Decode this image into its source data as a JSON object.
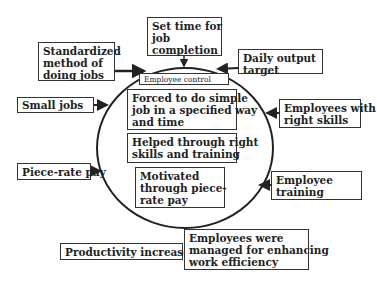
{
  "diagram": {
    "center_label": "Employee control",
    "inner_boxes": [
      {
        "id": "forced",
        "lines": [
          "Forced to do simple",
          "job in a specified way",
          "and time"
        ]
      },
      {
        "id": "helped",
        "lines": [
          "Helped through right",
          "skills and training"
        ]
      },
      {
        "id": "motivated",
        "lines": [
          "Motivated",
          "through piece-",
          "rate pay"
        ]
      }
    ],
    "outer_inputs": [
      {
        "id": "set-time",
        "lines": [
          "Set time for",
          "job",
          "completion"
        ]
      },
      {
        "id": "daily-output",
        "lines": [
          "Daily output",
          "target"
        ]
      },
      {
        "id": "standardized",
        "lines": [
          "Standardized",
          "method of",
          "doing jobs"
        ]
      },
      {
        "id": "small-jobs",
        "lines": [
          "Small jobs"
        ]
      },
      {
        "id": "right-skills",
        "lines": [
          "Employees with",
          "right skills"
        ]
      },
      {
        "id": "piece-rate",
        "lines": [
          "Piece-rate pay"
        ]
      },
      {
        "id": "training",
        "lines": [
          "Employee",
          "training"
        ]
      }
    ],
    "outcomes": [
      {
        "id": "productivity",
        "lines": [
          "Productivity increased"
        ]
      },
      {
        "id": "efficiency",
        "lines": [
          "Employees were",
          "managed for enhancing",
          "work efficiency"
        ]
      }
    ],
    "colors": {
      "stroke": "#222222",
      "box_border": "#333333",
      "background": "#ffffff"
    }
  }
}
